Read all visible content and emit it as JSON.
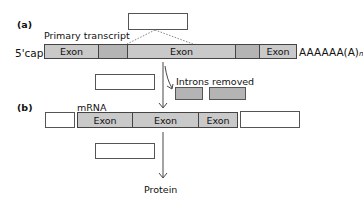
{
  "panel_a": {
    "label": "(a)",
    "title": "Primary transcript",
    "cap_label": "5'cap",
    "tail_label": "AAAAAA(A)",
    "tail_subscript": "n",
    "segments": [
      {
        "type": "exon",
        "label": "Exon"
      },
      {
        "type": "intron",
        "label": ""
      },
      {
        "type": "exon",
        "label": "Exon"
      },
      {
        "type": "intron",
        "label": ""
      },
      {
        "type": "exon",
        "label": "Exon"
      }
    ]
  },
  "introns_removed": {
    "label": "Introns removed"
  },
  "panel_b": {
    "label": "(b)",
    "title": "mRNA",
    "segments": [
      {
        "type": "exon",
        "label": "Exon"
      },
      {
        "type": "exon",
        "label": "Exon"
      },
      {
        "type": "exon",
        "label": "Exon"
      }
    ]
  },
  "product": {
    "label": "Protein"
  },
  "colors": {
    "exon": "#c9c9c9",
    "intron": "#b4b4b4",
    "border": "#444444"
  }
}
